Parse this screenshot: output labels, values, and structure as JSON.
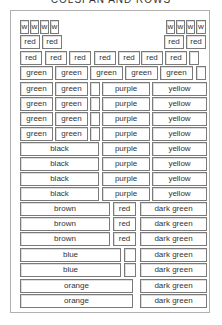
{
  "title": "COLSPAN AND ROWS",
  "rows": [
    {
      "y": 20,
      "cells": [
        {
          "x": 20,
          "w": 9,
          "label": "w"
        },
        {
          "x": 30,
          "w": 9,
          "label": "w"
        },
        {
          "x": 40,
          "w": 9,
          "label": "w"
        },
        {
          "x": 50,
          "w": 9,
          "label": "w"
        },
        {
          "x": 166,
          "w": 9,
          "label": "w"
        },
        {
          "x": 176,
          "w": 9,
          "label": "w"
        },
        {
          "x": 186,
          "w": 9,
          "label": "w"
        },
        {
          "x": 196,
          "w": 10,
          "label": "w"
        }
      ]
    },
    {
      "y": 35,
      "cells": [
        {
          "x": 20,
          "w": 20,
          "label": "red"
        },
        {
          "x": 42,
          "w": 20,
          "label": "red"
        },
        {
          "x": 164,
          "w": 20,
          "label": "red"
        },
        {
          "x": 186,
          "w": 20,
          "label": "red"
        }
      ]
    },
    {
      "y": 51,
      "cells": [
        {
          "x": 20,
          "w": 22,
          "label": "red"
        },
        {
          "x": 45,
          "w": 22,
          "label": "red"
        },
        {
          "x": 69,
          "w": 22,
          "label": "red"
        },
        {
          "x": 94,
          "w": 22,
          "label": "red"
        },
        {
          "x": 118,
          "w": 22,
          "label": "red"
        },
        {
          "x": 141,
          "w": 22,
          "label": "red"
        },
        {
          "x": 165,
          "w": 22,
          "label": "red"
        },
        {
          "x": 189,
          "w": 10,
          "label": ""
        }
      ]
    },
    {
      "y": 66,
      "cells": [
        {
          "x": 20,
          "w": 33,
          "label": "green"
        },
        {
          "x": 55,
          "w": 33,
          "label": "green"
        },
        {
          "x": 90,
          "w": 33,
          "label": "green"
        },
        {
          "x": 125,
          "w": 33,
          "label": "green"
        },
        {
          "x": 160,
          "w": 33,
          "label": "green"
        },
        {
          "x": 196,
          "w": 10,
          "label": ""
        }
      ]
    },
    {
      "y": 82,
      "cells": [
        {
          "x": 20,
          "w": 33,
          "label": "green"
        },
        {
          "x": 55,
          "w": 33,
          "label": "green"
        },
        {
          "x": 90,
          "w": 10,
          "label": ""
        },
        {
          "x": 102,
          "w": 48,
          "label": "purple"
        },
        {
          "x": 152,
          "w": 55,
          "label": "yellow"
        }
      ]
    },
    {
      "y": 97,
      "cells": [
        {
          "x": 20,
          "w": 33,
          "label": "green"
        },
        {
          "x": 55,
          "w": 33,
          "label": "green"
        },
        {
          "x": 90,
          "w": 10,
          "label": ""
        },
        {
          "x": 102,
          "w": 48,
          "label": "purple"
        },
        {
          "x": 152,
          "w": 55,
          "label": "yellow"
        }
      ]
    },
    {
      "y": 112,
      "cells": [
        {
          "x": 20,
          "w": 33,
          "label": "green"
        },
        {
          "x": 55,
          "w": 33,
          "label": "green"
        },
        {
          "x": 90,
          "w": 10,
          "label": ""
        },
        {
          "x": 102,
          "w": 48,
          "label": "purple"
        },
        {
          "x": 152,
          "w": 55,
          "label": "yellow"
        }
      ]
    },
    {
      "y": 127,
      "cells": [
        {
          "x": 20,
          "w": 33,
          "label": "green"
        },
        {
          "x": 55,
          "w": 33,
          "label": "green"
        },
        {
          "x": 90,
          "w": 10,
          "label": ""
        },
        {
          "x": 102,
          "w": 48,
          "label": "purple"
        },
        {
          "x": 152,
          "w": 55,
          "label": "yellow"
        }
      ]
    },
    {
      "y": 142,
      "cells": [
        {
          "x": 20,
          "w": 79,
          "label": "black"
        },
        {
          "x": 102,
          "w": 48,
          "label": "purple"
        },
        {
          "x": 152,
          "w": 55,
          "label": "yellow"
        }
      ]
    },
    {
      "y": 157,
      "cells": [
        {
          "x": 20,
          "w": 79,
          "label": "black"
        },
        {
          "x": 102,
          "w": 48,
          "label": "purple"
        },
        {
          "x": 152,
          "w": 55,
          "label": "yellow"
        }
      ]
    },
    {
      "y": 172,
      "cells": [
        {
          "x": 20,
          "w": 79,
          "label": "black"
        },
        {
          "x": 102,
          "w": 48,
          "label": "purple"
        },
        {
          "x": 152,
          "w": 55,
          "label": "yellow"
        }
      ]
    },
    {
      "y": 187,
      "cells": [
        {
          "x": 20,
          "w": 79,
          "label": "black"
        },
        {
          "x": 102,
          "w": 48,
          "label": "purple"
        },
        {
          "x": 152,
          "w": 55,
          "label": "yellow"
        }
      ]
    },
    {
      "y": 202,
      "cells": [
        {
          "x": 20,
          "w": 90,
          "label": "brown"
        },
        {
          "x": 113,
          "w": 23,
          "label": "red"
        },
        {
          "x": 140,
          "w": 67,
          "label": "dark green"
        }
      ]
    },
    {
      "y": 217,
      "cells": [
        {
          "x": 20,
          "w": 90,
          "label": "brown"
        },
        {
          "x": 113,
          "w": 23,
          "label": "red"
        },
        {
          "x": 140,
          "w": 67,
          "label": "dark green"
        }
      ]
    },
    {
      "y": 232,
      "cells": [
        {
          "x": 20,
          "w": 90,
          "label": "brown"
        },
        {
          "x": 113,
          "w": 23,
          "label": "red"
        },
        {
          "x": 140,
          "w": 67,
          "label": "dark green"
        }
      ]
    },
    {
      "y": 248,
      "cells": [
        {
          "x": 20,
          "w": 101,
          "label": "blue"
        },
        {
          "x": 124,
          "w": 12,
          "label": ""
        },
        {
          "x": 140,
          "w": 67,
          "label": "dark green"
        }
      ]
    },
    {
      "y": 263,
      "cells": [
        {
          "x": 20,
          "w": 101,
          "label": "blue"
        },
        {
          "x": 124,
          "w": 12,
          "label": ""
        },
        {
          "x": 140,
          "w": 67,
          "label": "dark green"
        }
      ]
    },
    {
      "y": 279,
      "cells": [
        {
          "x": 20,
          "w": 113,
          "label": "orange"
        },
        {
          "x": 140,
          "w": 67,
          "label": "dark green"
        }
      ]
    },
    {
      "y": 294,
      "cells": [
        {
          "x": 20,
          "w": 113,
          "label": "orange"
        },
        {
          "x": 140,
          "w": 67,
          "label": "dark green"
        }
      ]
    }
  ]
}
